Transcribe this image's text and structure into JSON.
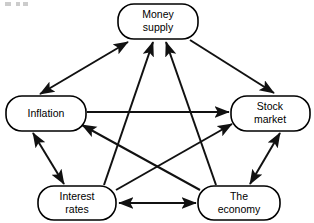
{
  "diagram": {
    "type": "node-link-diagram",
    "colors": {
      "node_fill": "#ffffff",
      "node_stroke": "#000000",
      "edge_stroke": "#111111",
      "text": "#000000",
      "background": "#ffffff"
    },
    "nodes": [
      {
        "id": "money-supply",
        "label_line1": "Money",
        "label_line2": "supply",
        "shape": "rounded-rectangle",
        "x": 118,
        "y": 4,
        "w": 80,
        "h": 35
      },
      {
        "id": "inflation",
        "label_line1": "Inflation",
        "label_line2": "",
        "shape": "rounded-rectangle",
        "x": 6,
        "y": 96,
        "w": 80,
        "h": 35
      },
      {
        "id": "stock-market",
        "label_line1": "Stock",
        "label_line2": "market",
        "shape": "rounded-rectangle",
        "x": 231,
        "y": 96,
        "w": 79,
        "h": 35
      },
      {
        "id": "interest-rates",
        "label_line1": "Interest",
        "label_line2": "rates",
        "shape": "rounded-rectangle",
        "x": 38,
        "y": 186,
        "w": 78,
        "h": 34
      },
      {
        "id": "the-economy",
        "label_line1": "The",
        "label_line2": "economy",
        "shape": "rounded-rectangle",
        "x": 198,
        "y": 186,
        "w": 82,
        "h": 34
      }
    ],
    "edges": [
      {
        "id": "inflation-moneysupply",
        "from": "inflation",
        "to": "money-supply",
        "direction": "both"
      },
      {
        "id": "moneysupply-stockmarket",
        "from": "money-supply",
        "to": "stock-market",
        "direction": "forward"
      },
      {
        "id": "interestrates-moneysupply",
        "from": "interest-rates",
        "to": "money-supply",
        "direction": "forward"
      },
      {
        "id": "theeconomy-moneysupply",
        "from": "the-economy",
        "to": "money-supply",
        "direction": "forward"
      },
      {
        "id": "inflation-stockmarket",
        "from": "inflation",
        "to": "stock-market",
        "direction": "forward"
      },
      {
        "id": "inflation-interestrates",
        "from": "inflation",
        "to": "interest-rates",
        "direction": "both"
      },
      {
        "id": "theeconomy-inflation",
        "from": "the-economy",
        "to": "inflation",
        "direction": "forward"
      },
      {
        "id": "interestrates-stockmarket",
        "from": "interest-rates",
        "to": "stock-market",
        "direction": "forward"
      },
      {
        "id": "stockmarket-theeconomy",
        "from": "stock-market",
        "to": "the-economy",
        "direction": "both"
      },
      {
        "id": "interestrates-theeconomy",
        "from": "interest-rates",
        "to": "the-economy",
        "direction": "both"
      }
    ]
  }
}
